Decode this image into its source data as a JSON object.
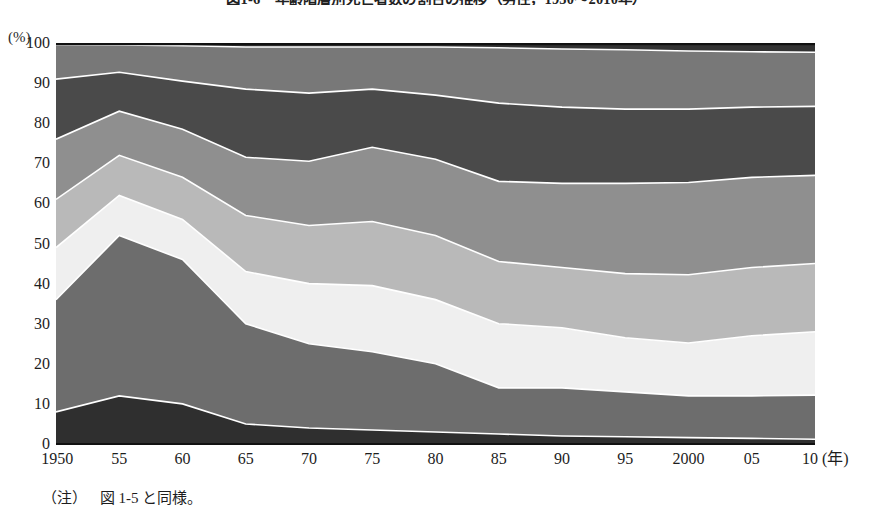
{
  "title": "図1-6　年齢階層別死亡者数の割合の推移（男性，1950～2010年）",
  "note": {
    "label": "（注）",
    "text": "図 1-5 と同様。"
  },
  "axis": {
    "y_unit": "(%)",
    "x_unit": "(年)"
  },
  "chart_data": {
    "type": "area",
    "stacked": true,
    "normalized_to_100": true,
    "title": "図1-6　年齢階層別死亡者数の割合の推移（男性，1950～2010年）",
    "xlabel": "(年)",
    "ylabel": "(%)",
    "ylim": [
      0,
      100
    ],
    "xlim": [
      1950,
      2010
    ],
    "grid": false,
    "legend_position": "none",
    "x": [
      1950,
      1955,
      1960,
      1965,
      1970,
      1975,
      1980,
      1985,
      1990,
      1995,
      2000,
      2005,
      2010
    ],
    "x_tick_labels": [
      "1950",
      "55",
      "60",
      "65",
      "70",
      "75",
      "80",
      "85",
      "90",
      "95",
      "2000",
      "05",
      "10"
    ],
    "y_tick_labels": [
      "0",
      "10",
      "20",
      "30",
      "40",
      "50",
      "60",
      "70",
      "80",
      "90",
      "100"
    ],
    "y_ticks": [
      0,
      10,
      20,
      30,
      40,
      50,
      60,
      70,
      80,
      90,
      100
    ],
    "series": [
      {
        "name": "band-1",
        "color": "#2f2f2f",
        "values": [
          8.0,
          12.0,
          10.0,
          5.0,
          4.0,
          3.5,
          3.0,
          2.5,
          2.0,
          1.8,
          1.6,
          1.4,
          1.2
        ],
        "cumulative": [
          8.0,
          12.0,
          10.0,
          5.0,
          4.0,
          3.5,
          3.0,
          2.5,
          2.0,
          1.8,
          1.6,
          1.4,
          1.2
        ]
      },
      {
        "name": "band-2",
        "color": "#6d6d6d",
        "values": [
          28.0,
          40.0,
          36.0,
          25.0,
          21.0,
          19.5,
          17.0,
          11.5,
          12.0,
          11.2,
          10.4,
          10.6,
          11.0
        ],
        "cumulative": [
          36.0,
          52.0,
          46.0,
          30.0,
          25.0,
          23.0,
          20.0,
          14.0,
          14.0,
          13.0,
          12.0,
          12.0,
          12.2
        ]
      },
      {
        "name": "band-3",
        "color": "#efefef",
        "values": [
          13.0,
          10.0,
          10.0,
          13.0,
          15.0,
          16.5,
          16.0,
          16.0,
          15.0,
          13.5,
          13.2,
          15.0,
          15.8
        ],
        "cumulative": [
          49.0,
          62.0,
          56.0,
          43.0,
          40.0,
          39.5,
          36.0,
          30.0,
          29.0,
          26.5,
          25.2,
          27.0,
          28.0
        ]
      },
      {
        "name": "band-4",
        "color": "#b9b9b9",
        "values": [
          12.0,
          10.0,
          10.5,
          14.0,
          14.5,
          16.0,
          16.0,
          15.5,
          15.0,
          16.0,
          17.0,
          17.0,
          17.0
        ],
        "cumulative": [
          61.0,
          72.0,
          66.5,
          57.0,
          54.5,
          55.5,
          52.0,
          45.5,
          44.0,
          42.5,
          42.2,
          44.0,
          45.0
        ]
      },
      {
        "name": "band-5",
        "color": "#8f8f8f",
        "values": [
          15.0,
          11.0,
          12.0,
          14.5,
          16.0,
          18.5,
          19.0,
          20.0,
          21.0,
          22.5,
          23.0,
          22.5,
          22.0
        ],
        "cumulative": [
          76.0,
          83.0,
          78.5,
          71.5,
          70.5,
          74.0,
          71.0,
          65.5,
          65.0,
          65.0,
          65.2,
          66.5,
          67.0
        ]
      },
      {
        "name": "band-6",
        "color": "#4a4a4a",
        "values": [
          15.0,
          9.7,
          12.0,
          17.0,
          17.0,
          14.5,
          16.0,
          19.5,
          19.0,
          18.5,
          18.3,
          17.5,
          17.2
        ],
        "cumulative": [
          91.0,
          92.7,
          90.5,
          88.5,
          87.5,
          88.5,
          87.0,
          85.0,
          84.0,
          83.5,
          83.5,
          84.0,
          84.2
        ]
      },
      {
        "name": "band-7",
        "color": "#787878",
        "values": [
          8.6,
          6.8,
          8.8,
          10.5,
          11.5,
          10.5,
          12.0,
          13.8,
          14.5,
          14.8,
          14.5,
          13.8,
          13.5
        ],
        "cumulative": [
          99.6,
          99.5,
          99.3,
          99.0,
          99.0,
          99.0,
          99.0,
          98.8,
          98.5,
          98.3,
          98.0,
          97.8,
          97.7
        ]
      },
      {
        "name": "band-8",
        "color": "#333333",
        "values": [
          0.4,
          0.5,
          0.7,
          1.0,
          1.0,
          1.0,
          1.0,
          1.2,
          1.5,
          1.7,
          2.0,
          2.2,
          2.3
        ],
        "cumulative": [
          100,
          100,
          100,
          100,
          100,
          100,
          100,
          100,
          100,
          100,
          100,
          100,
          100
        ]
      }
    ]
  }
}
